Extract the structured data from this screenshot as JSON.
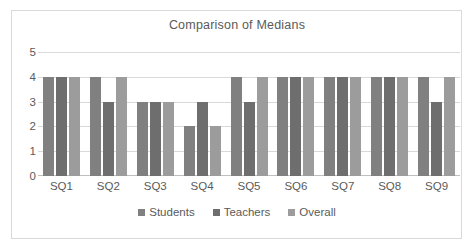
{
  "chart_data": {
    "type": "bar",
    "title": "Comparison of Medians",
    "xlabel": "",
    "ylabel": "",
    "categories": [
      "SQ1",
      "SQ2",
      "SQ3",
      "SQ4",
      "SQ5",
      "SQ6",
      "SQ7",
      "SQ8",
      "SQ9"
    ],
    "series": [
      {
        "name": "Students",
        "color": "#808080",
        "values": [
          4,
          4,
          3,
          2,
          4,
          4,
          4,
          4,
          4
        ]
      },
      {
        "name": "Teachers",
        "color": "#6e6e6e",
        "values": [
          4,
          3,
          3,
          3,
          3,
          4,
          4,
          4,
          3
        ]
      },
      {
        "name": "Overall",
        "color": "#9c9c9c",
        "values": [
          4,
          4,
          3,
          2,
          4,
          4,
          4,
          4,
          4
        ]
      }
    ],
    "ylim": [
      0,
      5
    ],
    "yticks": [
      "0",
      "1",
      "2",
      "3",
      "4",
      "5"
    ],
    "grid": true,
    "legend_position": "bottom",
    "plot_background": "#ffffff",
    "gridline_color": "#d9d9d9",
    "text_color": "#5a5a5a",
    "border_color": "#d9d9d9"
  }
}
